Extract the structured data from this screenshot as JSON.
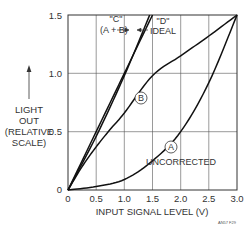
{
  "chart_data": {
    "type": "line",
    "title": "",
    "xlabel": "INPUT SIGNAL LEVEL (V)",
    "ylabel": [
      "LIGHT",
      "OUT",
      "(RELATIVE",
      "SCALE)"
    ],
    "xlim": [
      0,
      3.0
    ],
    "ylim": [
      0,
      1.5
    ],
    "xticks": [
      "0",
      "0.5",
      "1.0",
      "1.5",
      "2.0",
      "2.5",
      "3.0"
    ],
    "yticks": [
      "0",
      "0.5",
      "1.0",
      "1.5"
    ],
    "grid": true,
    "series": [
      {
        "name": "A",
        "label": "UNCORRECTED",
        "x": [
          0,
          0.5,
          1.0,
          1.5,
          2.0,
          2.5,
          3.0
        ],
        "y": [
          0,
          0.03,
          0.09,
          0.25,
          0.5,
          0.92,
          1.5
        ]
      },
      {
        "name": "B",
        "label": "",
        "x": [
          0,
          0.25,
          0.5,
          0.75,
          1.0,
          1.5,
          2.0,
          2.5,
          3.0
        ],
        "y": [
          0,
          0.2,
          0.37,
          0.52,
          0.66,
          0.98,
          1.15,
          1.32,
          1.5
        ]
      },
      {
        "name": "C",
        "label": "\"C\" (A + B)",
        "x": [
          0,
          0.5,
          1.0,
          1.45
        ],
        "y": [
          0,
          0.46,
          0.98,
          1.5
        ]
      },
      {
        "name": "D",
        "label": "\"D\" IDEAL",
        "x": [
          0,
          0.5,
          1.0,
          1.5
        ],
        "y": [
          0,
          0.5,
          1.0,
          1.5
        ]
      }
    ],
    "annotations": [
      {
        "text": "\"C\"",
        "line2": "(A + B)"
      },
      {
        "text": "\"D\"",
        "line2": "IDEAL"
      },
      {
        "text": "A",
        "circled": true
      },
      {
        "text": "B",
        "circled": true
      },
      {
        "text": "UNCORRECTED"
      }
    ],
    "footnote": "AN57 F29"
  }
}
